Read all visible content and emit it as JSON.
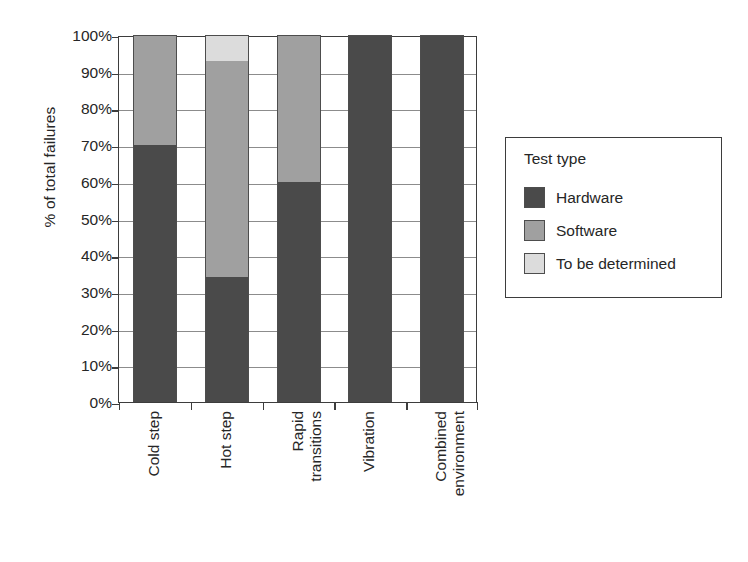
{
  "chart_data": {
    "type": "bar",
    "subtype": "100% stacked bar",
    "title": "",
    "xlabel": "",
    "ylabel": "% of total failures",
    "ylim": [
      0,
      100
    ],
    "grid": true,
    "legend_position": "right",
    "legend_title": "Test type",
    "categories": [
      "Cold step",
      "Hot step",
      "Rapid transitions",
      "Vibration",
      "Combined environment"
    ],
    "category_lines": [
      [
        "Cold step"
      ],
      [
        "Hot step"
      ],
      [
        "Rapid",
        "transitions"
      ],
      [
        "Vibration"
      ],
      [
        "Combined",
        "environment"
      ]
    ],
    "series": [
      {
        "name": "Hardware",
        "color": "#4a4a4a",
        "values": [
          70,
          34,
          60,
          100,
          100
        ]
      },
      {
        "name": "Software",
        "color": "#a0a0a0",
        "values": [
          30,
          59,
          40,
          0,
          0
        ]
      },
      {
        "name": "To be determined",
        "color": "#dcdcdc",
        "values": [
          0,
          7,
          0,
          0,
          0
        ]
      }
    ],
    "ytick_labels": [
      "0%",
      "10%",
      "20%",
      "30%",
      "40%",
      "50%",
      "60%",
      "70%",
      "80%",
      "90%",
      "100%"
    ],
    "ytick_values": [
      0,
      10,
      20,
      30,
      40,
      50,
      60,
      70,
      80,
      90,
      100
    ]
  },
  "axis": {
    "y_title": "% of total failures"
  },
  "legend": {
    "title": "Test type",
    "entries": [
      {
        "label": "Hardware",
        "color": "#4a4a4a"
      },
      {
        "label": "Software",
        "color": "#a0a0a0"
      },
      {
        "label": "To be determined",
        "color": "#dcdcdc"
      }
    ]
  },
  "colors": {
    "hardware": "#4a4a4a",
    "software": "#a0a0a0",
    "to_be_determined": "#dcdcdc",
    "axis": "#3d3d3d",
    "gridline": "#8c8c8c",
    "background": "#ffffff"
  }
}
